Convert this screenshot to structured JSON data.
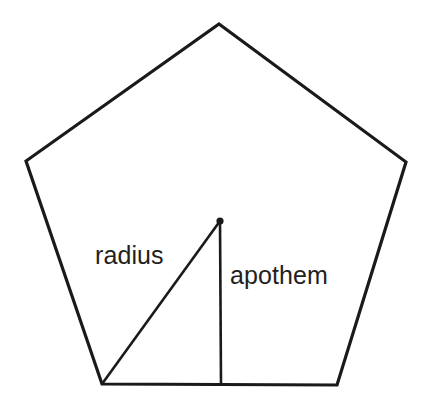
{
  "figure": {
    "background_color": "#ffffff",
    "stroke_color": "#1a1a1a",
    "text_color": "#231f20",
    "width": 431,
    "height": 405
  },
  "chart_data": {
    "type": "diagram",
    "shape": "regular-pentagon",
    "units": "pixels",
    "canvas": {
      "width": 431,
      "height": 405
    },
    "vertices": [
      {
        "name": "apex",
        "x": 219,
        "y": 24
      },
      {
        "name": "upper-right",
        "x": 406,
        "y": 162
      },
      {
        "name": "lower-right",
        "x": 337,
        "y": 385
      },
      {
        "name": "lower-left",
        "x": 102,
        "y": 384
      },
      {
        "name": "upper-left",
        "x": 26,
        "y": 161
      }
    ],
    "center": {
      "name": "center",
      "x": 220,
      "y": 221,
      "dot_radius": 3.6
    },
    "segments": [
      {
        "name": "radius",
        "from": {
          "x": 102,
          "y": 384
        },
        "to": {
          "x": 220,
          "y": 221
        },
        "stroke_width": 2.6,
        "description": "segment from center to a vertex"
      },
      {
        "name": "apothem",
        "from": {
          "x": 220,
          "y": 221
        },
        "to": {
          "x": 221,
          "y": 384
        },
        "stroke_width": 2.6,
        "description": "perpendicular segment from center to midpoint of a side"
      }
    ],
    "annotations": [
      {
        "name": "radius-label",
        "text": "radius",
        "x": 95,
        "y": 264,
        "font_size": 25
      },
      {
        "name": "apothem-label",
        "text": "apothem",
        "x": 230,
        "y": 284,
        "font_size": 25
      }
    ],
    "grid": false,
    "legend": null,
    "axes": null
  },
  "labels": {
    "radius": "radius",
    "apothem": "apothem"
  }
}
